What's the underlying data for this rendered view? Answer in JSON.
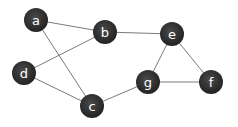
{
  "graph": {
    "node_color": "#2e2e2e",
    "edge_color": "#7a7a7a",
    "label_color": "#ffffff",
    "node_radius": 12,
    "nodes": [
      {
        "id": "a",
        "label": "a",
        "x": 36,
        "y": 20
      },
      {
        "id": "b",
        "label": "b",
        "x": 105,
        "y": 32
      },
      {
        "id": "d",
        "label": "d",
        "x": 24,
        "y": 73
      },
      {
        "id": "c",
        "label": "c",
        "x": 92,
        "y": 106
      },
      {
        "id": "e",
        "label": "e",
        "x": 172,
        "y": 34
      },
      {
        "id": "g",
        "label": "g",
        "x": 148,
        "y": 82
      },
      {
        "id": "f",
        "label": "f",
        "x": 211,
        "y": 82
      }
    ],
    "edges": [
      {
        "from": "a",
        "to": "b"
      },
      {
        "from": "a",
        "to": "c"
      },
      {
        "from": "d",
        "to": "b"
      },
      {
        "from": "d",
        "to": "c"
      },
      {
        "from": "c",
        "to": "g"
      },
      {
        "from": "b",
        "to": "e"
      },
      {
        "from": "e",
        "to": "g"
      },
      {
        "from": "e",
        "to": "f"
      },
      {
        "from": "g",
        "to": "f"
      }
    ]
  }
}
